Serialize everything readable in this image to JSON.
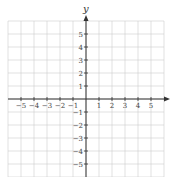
{
  "chart_data": {
    "type": "scatter",
    "title": "",
    "xlabel": "x",
    "ylabel": "y",
    "xlim": [
      -6,
      6
    ],
    "ylim": [
      -6,
      6
    ],
    "grid": true,
    "x_ticks": [
      "−5",
      "−4",
      "−3",
      "−2",
      "−1",
      "1",
      "2",
      "3",
      "4",
      "5"
    ],
    "y_ticks": [
      "5",
      "4",
      "3",
      "2",
      "1",
      "−1",
      "−2",
      "−3",
      "−4",
      "−5"
    ],
    "series": []
  },
  "colors": {
    "grid": "#cfcfcf",
    "axis": "#333333"
  }
}
